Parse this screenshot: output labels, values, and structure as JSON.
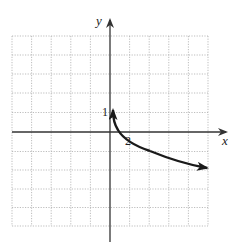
{
  "graph": {
    "x_axis_label": "x",
    "y_axis_label": "y",
    "y_tick_label": "1",
    "x_tick_label": "2",
    "grid": {
      "cols": 10,
      "rows": 10
    },
    "colors": {
      "grid": "#b5b5b5",
      "axis": "#333333",
      "curve": "#1a1a1a"
    }
  }
}
